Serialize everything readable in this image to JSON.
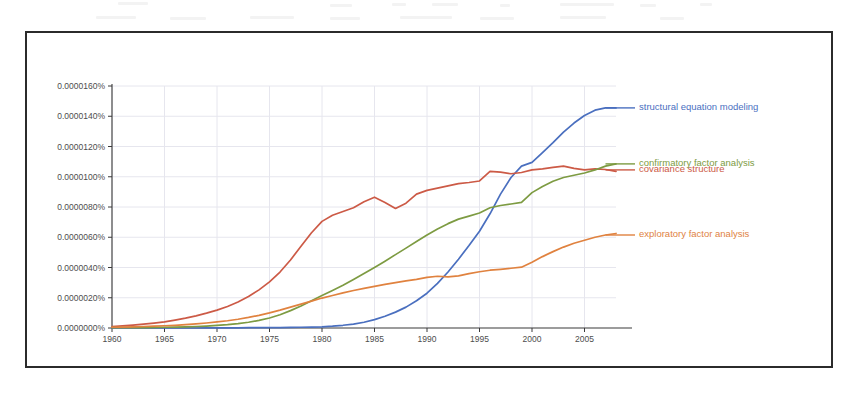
{
  "chart_data": {
    "type": "line",
    "title": "",
    "xlabel": "",
    "ylabel": "",
    "xlim": [
      1960,
      2008
    ],
    "ylim": [
      0.0,
      1.6e-05
    ],
    "grid": true,
    "legend_position": "right-inline-labels",
    "y_tick_labels": [
      "0.0000160%",
      "0.0000140%",
      "0.0000120%",
      "0.0000100%",
      "0.0000080%",
      "0.0000060%",
      "0.0000040%",
      "0.0000020%",
      "0.0000000%"
    ],
    "y_tick_values": [
      1.6e-05,
      1.4e-05,
      1.2e-05,
      1e-05,
      8e-06,
      6e-06,
      4e-06,
      2e-06,
      0.0
    ],
    "x_tick_labels": [
      "1960",
      "1965",
      "1970",
      "1975",
      "1980",
      "1985",
      "1990",
      "1995",
      "2000",
      "2005"
    ],
    "x_tick_values": [
      1960,
      1965,
      1970,
      1975,
      1980,
      1985,
      1990,
      1995,
      2000,
      2005
    ],
    "x": [
      1960,
      1961,
      1962,
      1963,
      1964,
      1965,
      1966,
      1967,
      1968,
      1969,
      1970,
      1971,
      1972,
      1973,
      1974,
      1975,
      1976,
      1977,
      1978,
      1979,
      1980,
      1981,
      1982,
      1983,
      1984,
      1985,
      1986,
      1987,
      1988,
      1989,
      1990,
      1991,
      1992,
      1993,
      1994,
      1995,
      1996,
      1997,
      1998,
      1999,
      2000,
      2001,
      2002,
      2003,
      2004,
      2005,
      2006,
      2007,
      2008
    ],
    "series": [
      {
        "name": "structural equation modeling",
        "color": "#4a6fbf",
        "values": [
          0.0,
          0.0,
          0.0,
          0.0,
          0.0,
          0.0,
          0.0,
          0.0,
          0.0,
          0.01,
          0.01,
          0.01,
          0.01,
          0.02,
          0.02,
          0.03,
          0.03,
          0.04,
          0.05,
          0.06,
          0.08,
          0.12,
          0.18,
          0.26,
          0.38,
          0.55,
          0.78,
          1.05,
          1.38,
          1.8,
          2.3,
          2.95,
          3.7,
          4.55,
          5.45,
          6.4,
          7.55,
          8.85,
          9.95,
          10.7,
          10.95,
          11.6,
          12.25,
          12.95,
          13.55,
          14.05,
          14.4,
          14.55,
          14.55
        ],
        "unit_scale": 1e-06,
        "label_at": {
          "year": 2007,
          "value": 14.55
        }
      },
      {
        "name": "covariance structure",
        "color": "#cc5a46",
        "values": [
          0.1,
          0.14,
          0.19,
          0.25,
          0.32,
          0.4,
          0.52,
          0.65,
          0.8,
          0.98,
          1.18,
          1.42,
          1.72,
          2.08,
          2.52,
          3.05,
          3.7,
          4.5,
          5.4,
          6.3,
          7.05,
          7.45,
          7.7,
          7.95,
          8.35,
          8.65,
          8.3,
          7.9,
          8.25,
          8.85,
          9.1,
          9.25,
          9.4,
          9.55,
          9.62,
          9.72,
          10.35,
          10.3,
          10.2,
          10.28,
          10.45,
          10.52,
          10.62,
          10.7,
          10.55,
          10.45,
          10.52,
          10.48,
          10.35
        ],
        "unit_scale": 1e-06,
        "label_at": {
          "year": 2007,
          "value": 10.45
        }
      },
      {
        "name": "confirmatory factor analysis",
        "color": "#7d9b42",
        "values": [
          0.02,
          0.02,
          0.03,
          0.03,
          0.04,
          0.05,
          0.06,
          0.08,
          0.1,
          0.13,
          0.17,
          0.22,
          0.29,
          0.38,
          0.5,
          0.66,
          0.88,
          1.15,
          1.45,
          1.8,
          2.15,
          2.48,
          2.82,
          3.2,
          3.6,
          4.0,
          4.42,
          4.85,
          5.28,
          5.72,
          6.15,
          6.55,
          6.9,
          7.2,
          7.4,
          7.6,
          7.95,
          8.1,
          8.2,
          8.3,
          8.95,
          9.35,
          9.7,
          9.95,
          10.1,
          10.25,
          10.45,
          10.7,
          10.85
        ],
        "unit_scale": 1e-06,
        "label_at": {
          "year": 2007,
          "value": 10.85
        }
      },
      {
        "name": "exploratory factor analysis",
        "color": "#e0823f",
        "values": [
          0.05,
          0.06,
          0.08,
          0.1,
          0.12,
          0.15,
          0.18,
          0.22,
          0.27,
          0.33,
          0.4,
          0.48,
          0.58,
          0.7,
          0.84,
          1.0,
          1.18,
          1.38,
          1.58,
          1.78,
          1.98,
          2.15,
          2.32,
          2.48,
          2.62,
          2.75,
          2.88,
          3.0,
          3.12,
          3.22,
          3.35,
          3.42,
          3.38,
          3.45,
          3.6,
          3.72,
          3.82,
          3.88,
          3.95,
          4.02,
          4.35,
          4.72,
          5.05,
          5.35,
          5.6,
          5.8,
          6.0,
          6.15,
          6.25
        ],
        "unit_scale": 1e-06,
        "label_at": {
          "year": 2007,
          "value": 6.15
        }
      }
    ]
  },
  "colors": {
    "structural_equation_modeling": "#4a6fbf",
    "covariance_structure": "#cc5a46",
    "confirmatory_factor_analysis": "#7d9b42",
    "exploratory_factor_analysis": "#e0823f",
    "frame_border": "#2b2b2b",
    "gridline": "#e6e6ee",
    "axis": "#3a3a3a",
    "tick_text": "#4d4d4d",
    "page_background": "#ffffff"
  }
}
